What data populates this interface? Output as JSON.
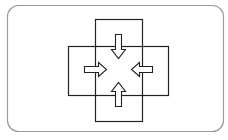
{
  "diagram": {
    "frame": {
      "x": 7.5,
      "y": 5.5,
      "width": 216,
      "height": 126,
      "radius": 11,
      "stroke": "#999999"
    },
    "vertical_rect": {
      "x": 95.5,
      "y": 19.5,
      "width": 47,
      "height": 102
    },
    "horizontal_rect": {
      "x": 68.5,
      "y": 46.5,
      "width": 100,
      "height": 49
    },
    "arrows": [
      {
        "name": "down-arrow",
        "direction": "down"
      },
      {
        "name": "right-arrow",
        "direction": "right"
      },
      {
        "name": "left-arrow",
        "direction": "left"
      },
      {
        "name": "up-arrow",
        "direction": "up"
      }
    ],
    "line_color": "#222222",
    "caption": "(illegible caption)"
  }
}
